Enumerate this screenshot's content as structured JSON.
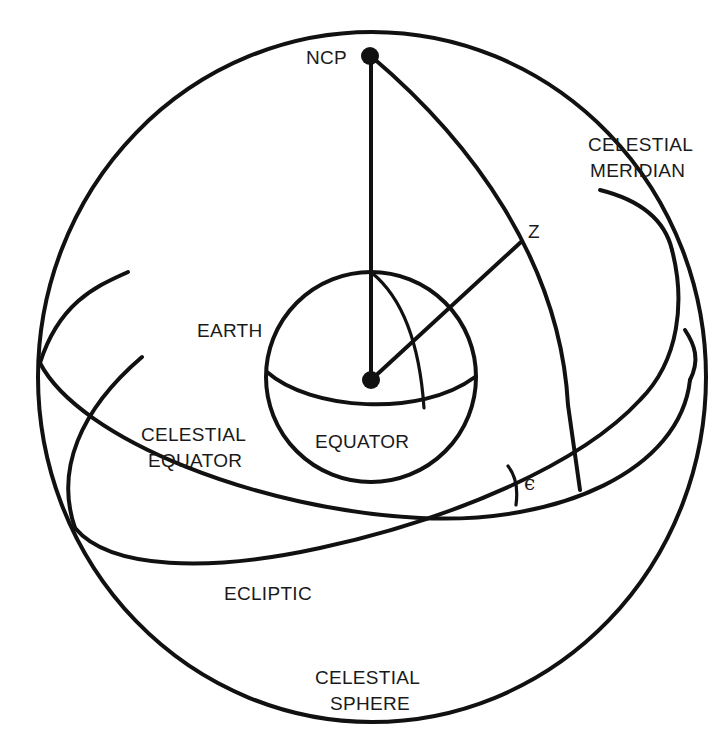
{
  "diagram": {
    "colors": {
      "ink": "#111111",
      "background": "#ffffff"
    },
    "labels": {
      "ncp": "NCP",
      "meridian_line1": "CELESTIAL",
      "meridian_line2": "MERIDIAN",
      "zenith": "Z",
      "earth": "EARTH",
      "earth_equator": "EQUATOR",
      "celestial_equator_line1": "CELESTIAL",
      "celestial_equator_line2": "EQUATOR",
      "obliquity": "ϵ",
      "ecliptic": "ECLIPTIC",
      "sphere_line1": "CELESTIAL",
      "sphere_line2": "SPHERE"
    },
    "points": [
      {
        "name": "NCP",
        "description": "North Celestial Pole"
      },
      {
        "name": "Earth center"
      },
      {
        "name": "Z",
        "description": "Zenith"
      }
    ]
  }
}
